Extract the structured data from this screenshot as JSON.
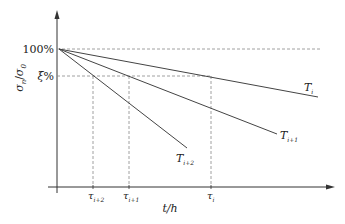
{
  "diagram": {
    "y_axis": {
      "label_main": "σ",
      "label_sub1": "n",
      "label_slash": "/",
      "label_sub2": "0",
      "ticks": [
        {
          "label": "100%",
          "y": 49
        },
        {
          "label_main": "ξ",
          "label_pct": "%",
          "y": 76
        }
      ]
    },
    "x_axis": {
      "label": "t/h",
      "ticks": [
        {
          "main": "τ",
          "sub": "i+2",
          "x": 93
        },
        {
          "main": "τ",
          "sub": "i+1",
          "x": 129
        },
        {
          "main": "τ",
          "sub": "i",
          "x": 211
        }
      ]
    },
    "curves": [
      {
        "main": "T",
        "sub": "i",
        "x1": 59,
        "y1": 49,
        "x2": 318,
        "y2": 97
      },
      {
        "main": "T",
        "sub": "i+1",
        "x1": 59,
        "y1": 49,
        "x2": 277,
        "y2": 134
      },
      {
        "main": "T",
        "sub": "i+2",
        "x1": 59,
        "y1": 49,
        "x2": 187,
        "y2": 148
      }
    ],
    "colors": {
      "axis": "#333333",
      "line": "#444444",
      "dashed": "#888888"
    }
  }
}
